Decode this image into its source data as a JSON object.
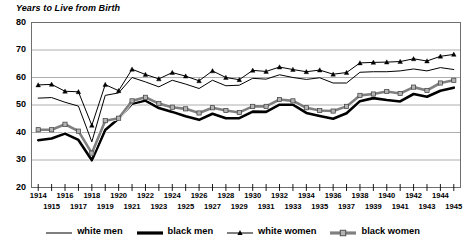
{
  "chart_data": {
    "type": "line",
    "title": "Years to Live from Birth",
    "xlabel": "",
    "ylabel": "",
    "ylim": [
      20,
      80
    ],
    "ytick_step": 10,
    "yticks": [
      20,
      30,
      40,
      50,
      60,
      70,
      80
    ],
    "grid": true,
    "legend_position": "bottom",
    "x": [
      1914,
      1915,
      1916,
      1917,
      1918,
      1919,
      1920,
      1921,
      1922,
      1923,
      1924,
      1925,
      1926,
      1927,
      1928,
      1929,
      1930,
      1931,
      1932,
      1933,
      1934,
      1935,
      1936,
      1937,
      1938,
      1939,
      1940,
      1941,
      1942,
      1943,
      1944,
      1945
    ],
    "series": [
      {
        "name": "white men",
        "color": "#000000",
        "line_width": 1.0,
        "marker": "none",
        "values": [
          52.5,
          52.7,
          51.0,
          49.6,
          36.6,
          53.5,
          54.4,
          60.0,
          58.4,
          56.6,
          59.0,
          57.6,
          56.0,
          59.0,
          57.0,
          57.2,
          59.7,
          59.4,
          61.0,
          60.0,
          59.3,
          59.9,
          58.0,
          58.0,
          61.9,
          62.1,
          62.1,
          62.4,
          63.1,
          62.4,
          63.6,
          62.9
        ]
      },
      {
        "name": "black men",
        "color": "#000000",
        "line_width": 2.6,
        "marker": "none",
        "values": [
          37.2,
          37.8,
          39.6,
          37.3,
          29.9,
          40.9,
          45.1,
          50.5,
          51.6,
          48.9,
          47.5,
          45.9,
          44.6,
          46.8,
          45.2,
          45.2,
          47.6,
          47.5,
          50.1,
          50.1,
          47.1,
          46.0,
          45.0,
          47.0,
          51.4,
          52.5,
          51.8,
          51.3,
          54.0,
          53.0,
          55.2,
          56.3
        ]
      },
      {
        "name": "white women",
        "color": "#000000",
        "line_width": 1.0,
        "marker": "triangle",
        "values": [
          57.3,
          57.5,
          55.0,
          54.8,
          42.6,
          57.4,
          55.2,
          63.0,
          61.1,
          59.5,
          61.8,
          60.5,
          58.8,
          62.4,
          60.0,
          59.2,
          62.6,
          62.2,
          63.8,
          62.9,
          62.1,
          62.7,
          61.2,
          61.8,
          65.3,
          65.5,
          65.6,
          65.8,
          66.8,
          66.0,
          67.7,
          68.4
        ]
      },
      {
        "name": "black women",
        "color": "#808080",
        "line_width": 2.6,
        "marker": "square",
        "values": [
          41.0,
          41.0,
          43.0,
          40.5,
          32.5,
          44.3,
          45.2,
          51.5,
          52.8,
          50.5,
          49.2,
          48.6,
          47.1,
          49.0,
          48.0,
          47.3,
          49.5,
          49.5,
          52.0,
          51.5,
          49.0,
          48.0,
          47.8,
          49.5,
          53.5,
          54.0,
          54.9,
          54.2,
          56.5,
          55.3,
          58.0,
          59.0
        ]
      }
    ]
  },
  "axes": {
    "y_labels": [
      "80",
      "70",
      "60",
      "50",
      "40",
      "30",
      "20"
    ],
    "x_labels": [
      "1914",
      "1915",
      "1916",
      "1917",
      "1918",
      "1919",
      "1920",
      "1921",
      "1922",
      "1923",
      "1924",
      "1925",
      "1926",
      "1927",
      "1928",
      "1929",
      "1930",
      "1931",
      "1932",
      "1933",
      "1934",
      "1935",
      "1936",
      "1937",
      "1938",
      "1939",
      "1940",
      "1941",
      "1942",
      "1943",
      "1944",
      "1945"
    ]
  },
  "legend": {
    "entries": [
      {
        "label": "white men",
        "style": "thin-black-line"
      },
      {
        "label": "black men",
        "style": "thick-black-line"
      },
      {
        "label": "white women",
        "style": "thin-line-triangle-marker"
      },
      {
        "label": "black women",
        "style": "thick-gray-line-square-marker"
      }
    ]
  }
}
